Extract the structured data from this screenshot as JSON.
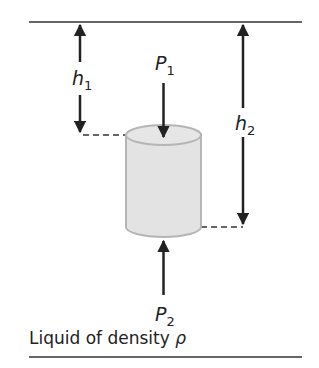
{
  "diagram": {
    "labels": {
      "h1": {
        "symbol": "h",
        "sub": "1"
      },
      "h2": {
        "symbol": "h",
        "sub": "2"
      },
      "p1": {
        "symbol": "P",
        "sub": "1"
      },
      "p2": {
        "symbol": "P",
        "sub": "2"
      }
    },
    "caption": {
      "text": "Liquid of density ",
      "symbol": "ρ"
    },
    "colors": {
      "line": "#222222",
      "cylinder_fill": "#e3e3e3",
      "cylinder_stroke": "#b5b5b5"
    }
  }
}
